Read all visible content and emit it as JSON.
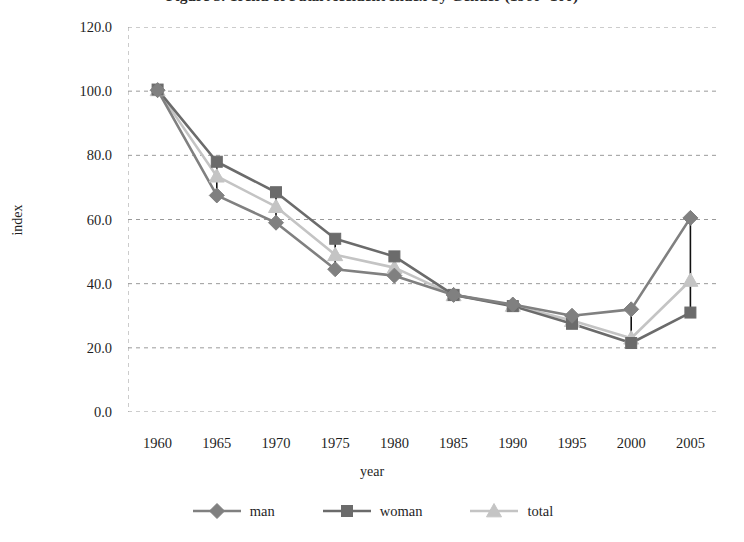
{
  "chart_data": {
    "type": "line",
    "title": "Figure 3. Trend of Fatal Accident Index by Gender (1960=100)",
    "xlabel": "year",
    "ylabel": "index",
    "x": [
      1960,
      1965,
      1970,
      1975,
      1980,
      1985,
      1990,
      1995,
      2000,
      2005
    ],
    "categories": [
      "1960",
      "1965",
      "1970",
      "1975",
      "1980",
      "1985",
      "1990",
      "1995",
      "2000",
      "2005"
    ],
    "series": [
      {
        "name": "man",
        "marker": "diamond",
        "color": "#808080",
        "values": [
          100.3,
          67.5,
          59.0,
          44.5,
          42.5,
          36.5,
          33.5,
          30.0,
          32.0,
          60.5
        ]
      },
      {
        "name": "woman",
        "marker": "square",
        "color": "#6b6b6b",
        "values": [
          100.5,
          78.0,
          68.5,
          54.0,
          48.5,
          36.5,
          33.0,
          27.5,
          21.5,
          31.0
        ]
      },
      {
        "name": "total",
        "marker": "triangle",
        "color": "#c4c4c4",
        "values": [
          100.4,
          73.5,
          64.0,
          49.0,
          45.0,
          36.5,
          33.2,
          28.5,
          23.0,
          41.0
        ]
      }
    ],
    "ylim": [
      0.0,
      120.0
    ],
    "ytick_values": [
      0.0,
      20.0,
      40.0,
      60.0,
      80.0,
      100.0,
      120.0
    ],
    "ytick_labels": [
      "0.0",
      "20.0",
      "40.0",
      "60.0",
      "80.0",
      "100.0",
      "120.0"
    ],
    "grid": true,
    "grid_style": "dashed",
    "grid_color": "#9a9a9a",
    "legend_position": "bottom-center",
    "annotations": "Vertical black connector segments join the man and woman points at each year."
  },
  "legend": {
    "items": [
      {
        "label": "man"
      },
      {
        "label": "woman"
      },
      {
        "label": "total"
      }
    ]
  }
}
